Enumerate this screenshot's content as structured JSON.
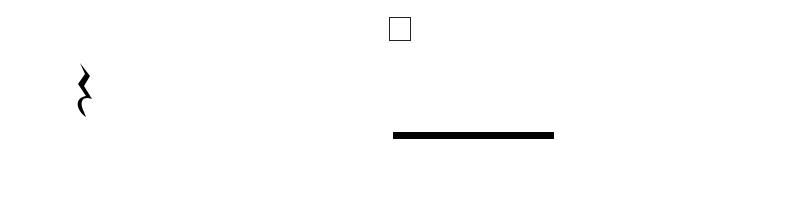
{
  "rehearsal_mark": "F",
  "staff": {
    "lines_y": [
      55,
      73,
      90,
      107,
      125
    ],
    "x_start": 38,
    "x_end": 759,
    "barlines_x": [
      373,
      759
    ]
  },
  "notes": [
    {
      "kind": "rest",
      "value": "quarter",
      "x": 85
    },
    {
      "label": "F",
      "x": 160,
      "y": 117,
      "stem": "up",
      "stem_end": 55
    },
    {
      "label": "A",
      "x": 232,
      "y": 99,
      "stem": "up",
      "stem_end": 38
    },
    {
      "label": "B",
      "x": 310,
      "y": 89,
      "stem": "down",
      "stem_end": 151,
      "accidental": "flat"
    },
    {
      "label": "C",
      "x": 401,
      "y": 80,
      "stem": "down",
      "beamed": true
    },
    {
      "label": "C",
      "x": 455,
      "y": 80,
      "stem": "down",
      "beamed": true
    },
    {
      "label": "C",
      "x": 509,
      "y": 80,
      "stem": "down",
      "beamed": true
    },
    {
      "label": "C",
      "x": 563,
      "y": 80,
      "stem": "down",
      "beamed": true
    },
    {
      "label": "A",
      "x": 617,
      "y": 99,
      "stem": "up",
      "stem_end": 37
    },
    {
      "label": "F",
      "x": 695,
      "y": 116,
      "stem": "up",
      "stem_end": 54
    }
  ],
  "syllable_bars": [
    {
      "x": 150,
      "w": 69,
      "color": "#808080"
    },
    {
      "x": 222,
      "w": 63,
      "color": "#d0d0d0"
    },
    {
      "x": 287,
      "w": 82,
      "color": "#4b4b4b"
    },
    {
      "x": 392,
      "w": 49,
      "color": "#333333"
    },
    {
      "x": 443,
      "w": 53,
      "color": "#333333"
    },
    {
      "x": 499,
      "w": 48,
      "color": "#333333"
    },
    {
      "x": 551,
      "w": 52,
      "color": "#333333"
    },
    {
      "x": 606,
      "w": 73,
      "color": "#d6d6d6"
    },
    {
      "x": 682,
      "w": 73,
      "color": "#858585"
    }
  ],
  "lyrics": [
    {
      "text": "I",
      "x": 158
    },
    {
      "text": "don’t",
      "x": 215
    },
    {
      "text": "know",
      "x": 292
    },
    {
      "text": "how",
      "x": 389
    },
    {
      "text": "I’m",
      "x": 443
    },
    {
      "text": "gon",
      "x": 497
    },
    {
      "text": "-",
      "x": 536
    },
    {
      "text": "na",
      "x": 556
    },
    {
      "text": "do",
      "x": 609
    },
    {
      "text": "it,",
      "x": 690
    }
  ]
}
